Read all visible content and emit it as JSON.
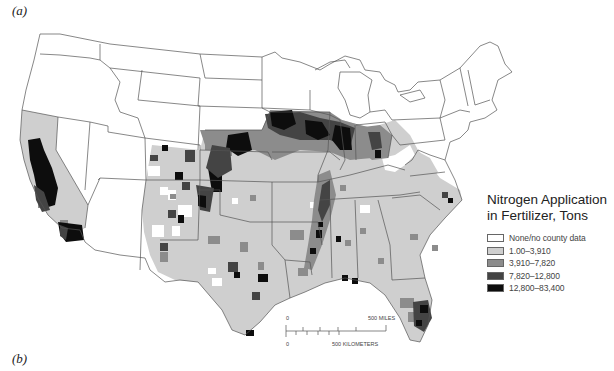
{
  "panels": {
    "top_label": "(a)",
    "bottom_label": "(b)"
  },
  "legend": {
    "title_line1": "Nitrogen Application",
    "title_line2": "in Fertilizer, Tons",
    "items": [
      {
        "label": "None/no county data",
        "color": "#ffffff"
      },
      {
        "label": "1.00–3,910",
        "color": "#cfcfcf"
      },
      {
        "label": "3,910–7,820",
        "color": "#8c8c8c"
      },
      {
        "label": "7,820–12,800",
        "color": "#444444"
      },
      {
        "label": "12,800–83,400",
        "color": "#0d0d0d"
      }
    ]
  },
  "scale_bar": {
    "miles_zero": "0",
    "miles_label": "500 MILES",
    "km_zero": "0",
    "km_label": "500 KILOMETERS"
  },
  "colors": {
    "none": "#ffffff",
    "class1": "#cfcfcf",
    "class2": "#8c8c8c",
    "class3": "#444444",
    "class4": "#0d0d0d",
    "border": "#555555"
  }
}
